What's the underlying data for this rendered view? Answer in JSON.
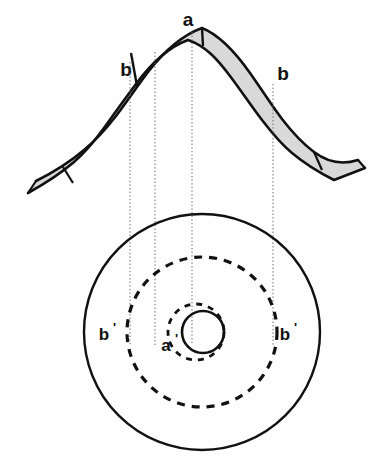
{
  "figure": {
    "background_color": "#fefefe",
    "line_color": "#111111",
    "band_fill_color": "#d9d9d9",
    "dotted_line_color": "#6b6b6b"
  },
  "cross_section": {
    "name": "fold-cross-section",
    "description": "Folded stratigraphic band forming an arch (anticline) with gray fill",
    "labels": {
      "apex": "a",
      "left_limb": "b",
      "right_limb": "b"
    },
    "label_positions": {
      "apex": {
        "x": 188,
        "y": 26
      },
      "left_limb": {
        "x": 126,
        "y": 76
      },
      "right_limb": {
        "x": 283,
        "y": 80
      }
    },
    "bed_contacts": [
      {
        "name": "left-outer-contact-tick"
      },
      {
        "name": "left-inner-contact-tick"
      },
      {
        "name": "right-inner-contact-tick"
      },
      {
        "name": "right-outer-contact-tick"
      }
    ]
  },
  "map_view": {
    "name": "outcrop-map-view",
    "description": "Concentric circular outcrop traces of the plunging fold",
    "center": {
      "x": 202,
      "y": 332
    },
    "circles": [
      {
        "name": "outer-circle",
        "style": "solid",
        "radius": 118
      },
      {
        "name": "middle-dashed-circle",
        "style": "dashed",
        "radius": 75
      },
      {
        "name": "inner-dashed-circle",
        "style": "dashed",
        "radius": 28
      },
      {
        "name": "core-circle",
        "style": "solid",
        "radius": 21
      }
    ],
    "labels": {
      "left_b_prime": "b",
      "right_b_prime": "b",
      "center_a_prime": "a",
      "prime": "'"
    },
    "label_positions": {
      "left_b_prime": {
        "x": 104,
        "y": 340
      },
      "right_b_prime": {
        "x": 285,
        "y": 340
      },
      "center_a_prime": {
        "x": 166,
        "y": 351
      }
    }
  },
  "projection_lines": {
    "name": "projection-lines",
    "style": "dotted",
    "count": 4,
    "x_positions": [
      130,
      155,
      192,
      273
    ],
    "y_top": 30,
    "y_bottom": 345
  }
}
